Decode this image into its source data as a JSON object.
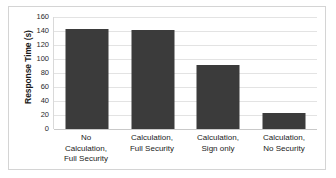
{
  "chart_data": {
    "type": "bar",
    "title": "",
    "xlabel": "",
    "ylabel": "Response Time (s)",
    "categories": [
      "No Calculation, Full Security",
      "Calculation, Full Security",
      "Calculation, Sign only",
      "Calculation, No Security"
    ],
    "category_lines": [
      [
        "No",
        "Calculation,",
        "Full Security"
      ],
      [
        "Calculation,",
        "Full Security"
      ],
      [
        "Calculation,",
        "Sign only"
      ],
      [
        "Calculation,",
        "No Security"
      ]
    ],
    "values": [
      143,
      141,
      92,
      23
    ],
    "ylim": [
      0,
      160
    ],
    "ytick_values": [
      0,
      20,
      40,
      60,
      80,
      100,
      120,
      140,
      160
    ],
    "ytick_labels": [
      "0",
      "20",
      "40",
      "60",
      "80",
      "100",
      "120",
      "140",
      "160"
    ],
    "grid": true,
    "legend": false,
    "bar_color": "#3b3b3b",
    "grid_color": "#e3e3e3",
    "axis_color": "#c9c9c9",
    "frame_color": "#d4d4d4",
    "background": "#ffffff",
    "text_color": "#1a1a1a"
  }
}
